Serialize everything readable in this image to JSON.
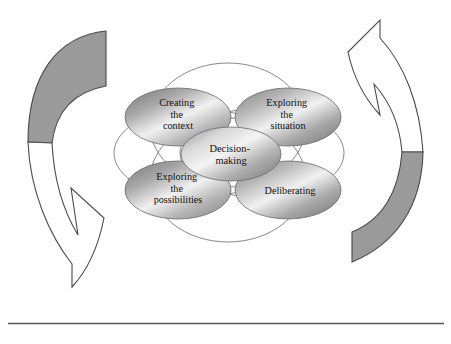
{
  "figure": {
    "background_color": "#ffffff",
    "rule_color": "#5a5a5a",
    "outline_color": "#7b7b7b"
  },
  "center_node": {
    "name": "decision-making",
    "lines": [
      "Decision-",
      "making"
    ],
    "fill_light": "#f2f2f2",
    "fill_dark": "#8d8d8d",
    "stroke": "#6a6a6a"
  },
  "nodes": [
    {
      "name": "creating-the-context",
      "position": "top-left",
      "lines": [
        "Creating",
        "the",
        "context"
      ],
      "fill_light": "#f0f0f0",
      "fill_dark": "#8a8a8a"
    },
    {
      "name": "exploring-the-situation",
      "position": "top-right",
      "lines": [
        "Exploring",
        "the",
        "situation"
      ],
      "fill_light": "#f0f0f0",
      "fill_dark": "#8a8a8a"
    },
    {
      "name": "exploring-the-possibilities",
      "position": "bottom-left",
      "lines": [
        "Exploring",
        "the",
        "possibilities"
      ],
      "fill_light": "#f0f0f0",
      "fill_dark": "#8a8a8a"
    },
    {
      "name": "deliberating",
      "position": "bottom-right",
      "lines": [
        "Deliberating"
      ],
      "fill_light": "#f0f0f0",
      "fill_dark": "#8a8a8a"
    }
  ],
  "arrows": [
    {
      "name": "left-cycle-arrow",
      "direction": "downward",
      "head_points": "down-right",
      "upper_fill": "#9a9a9a",
      "lower_fill": "#ffffff",
      "stroke": "#4a4a4a"
    },
    {
      "name": "right-cycle-arrow",
      "direction": "upward",
      "head_points": "up-left",
      "upper_fill": "#ffffff",
      "lower_fill": "#9a9a9a",
      "stroke": "#4a4a4a"
    }
  ]
}
